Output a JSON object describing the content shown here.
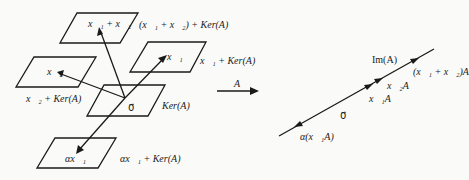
{
  "diagram": {
    "left_cosets": {
      "sum": {
        "vector_label": "x⃗₁ + x⃗₂",
        "coset_label": "(x⃗₁ + x⃗₂) + Ker(A)"
      },
      "x1": {
        "vector_label": "x⃗₁",
        "coset_label": "x⃗₁ + Ker(A)"
      },
      "x2": {
        "vector_label": "x⃗₂",
        "coset_label": "x⃗₂ + Ker(A)"
      },
      "kernel": {
        "vector_label": "0⃗",
        "coset_label": "Ker(A)"
      },
      "scaled": {
        "vector_label": "αx⃗₁",
        "coset_label": "αx⃗₁ + Ker(A)"
      }
    },
    "map": {
      "label": "A"
    },
    "image_line": {
      "line_label": "Im(A)",
      "points": {
        "sum": "(x⃗₁ + x⃗₂)A",
        "x2": "x⃗₂A",
        "x1": "x⃗₁A",
        "zero": "0⃗",
        "scaled": "α(x⃗₁A)"
      }
    }
  }
}
